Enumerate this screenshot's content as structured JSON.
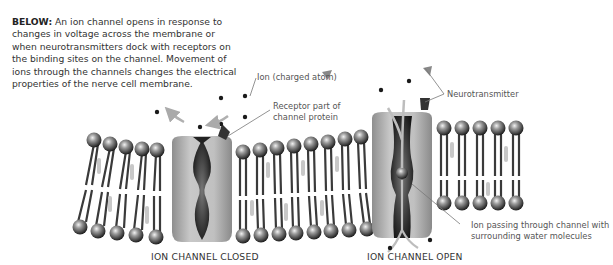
{
  "caption": {
    "lead": "BELOW:",
    "text": " An ion channel opens in response to changes in voltage across the membrane or when neurotransmitters dock with receptors on the binding sites on the channel. Movement of ions through the channels changes the electrical properties of the nerve cell membrane."
  },
  "labels": {
    "ion": "Ion (charged atom)",
    "receptor_line1": "Receptor part of",
    "receptor_line2": "channel protein",
    "neurotransmitter": "Neurotransmitter",
    "ion_passing_line1": "Ion passing through channel with",
    "ion_passing_line2": "surrounding water molecules"
  },
  "titles": {
    "closed": "ION CHANNEL CLOSED",
    "open": "ION CHANNEL OPEN"
  },
  "colors": {
    "protein": "#b5b5b5",
    "pore": "#2a2a2a",
    "lipid_head": "#3a3a3a",
    "leader_line": "#777777"
  }
}
